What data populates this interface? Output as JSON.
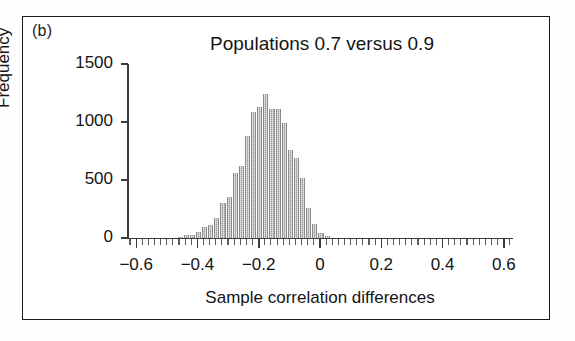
{
  "panel": {
    "label": "(b)"
  },
  "chart_data": {
    "type": "bar",
    "title": "Populations 0.7 versus 0.9",
    "xlabel": "Sample correlation differences",
    "ylabel": "Frequency",
    "xlim": [
      -0.63,
      0.63
    ],
    "ylim": [
      0,
      1500
    ],
    "xticks": [
      -0.6,
      -0.4,
      -0.2,
      0,
      0.2,
      0.4,
      0.6
    ],
    "xtick_labels": [
      "−0.6",
      "−0.4",
      "−0.2",
      "0",
      "0.2",
      "0.4",
      "0.6"
    ],
    "yticks": [
      0,
      500,
      1000,
      1500
    ],
    "ytick_labels": [
      "0",
      "500",
      "1000",
      "1500"
    ],
    "grid": false,
    "legend": "none",
    "bin_width": 0.02,
    "bar_color": "#9b9b9b",
    "categories": [
      "-0.46",
      "-0.44",
      "-0.42",
      "-0.40",
      "-0.38",
      "-0.36",
      "-0.34",
      "-0.32",
      "-0.30",
      "-0.28",
      "-0.26",
      "-0.24",
      "-0.22",
      "-0.20",
      "-0.18",
      "-0.16",
      "-0.14",
      "-0.12",
      "-0.10",
      "-0.08",
      "-0.06",
      "-0.04",
      "-0.02",
      "0.00",
      "0.02"
    ],
    "values": [
      10,
      25,
      30,
      55,
      95,
      110,
      175,
      300,
      350,
      560,
      620,
      880,
      1090,
      1130,
      1240,
      1110,
      1110,
      990,
      760,
      690,
      520,
      255,
      120,
      45,
      20
    ]
  }
}
